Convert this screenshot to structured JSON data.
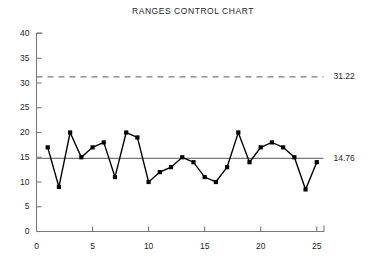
{
  "chart_data": {
    "type": "line",
    "title": "RANGES CONTROL CHART",
    "xlabel": "",
    "ylabel": "",
    "xlim": [
      0,
      25.6
    ],
    "ylim": [
      0,
      40
    ],
    "xticks": [
      0,
      5,
      10,
      15,
      20,
      25
    ],
    "yticks": [
      0,
      5,
      10,
      15,
      20,
      25,
      30,
      35,
      40
    ],
    "grid": false,
    "legend": false,
    "x": [
      1,
      2,
      3,
      4,
      5,
      6,
      7,
      8,
      9,
      10,
      11,
      12,
      13,
      14,
      15,
      16,
      17,
      18,
      19,
      20,
      21,
      22,
      23,
      24,
      25
    ],
    "values": [
      17,
      9,
      20,
      15,
      17,
      18,
      11,
      20,
      19,
      10,
      12,
      13,
      15,
      14,
      11,
      10,
      13,
      20,
      14,
      17,
      18,
      17,
      15,
      8.5,
      14
    ],
    "series": [
      {
        "name": "Range",
        "values": [
          17,
          9,
          20,
          15,
          17,
          18,
          11,
          20,
          19,
          10,
          12,
          13,
          15,
          14,
          11,
          10,
          13,
          20,
          14,
          17,
          18,
          17,
          15,
          8.5,
          14
        ]
      }
    ],
    "reference_lines": [
      {
        "name": "upper-control-limit",
        "label": "31.22",
        "value": 31.22,
        "style": "dashed"
      },
      {
        "name": "center-line",
        "label": "14.76",
        "value": 14.76,
        "style": "solid"
      }
    ],
    "colors": {
      "series": "#000000",
      "axis": "#7a7a7a",
      "reference_line": "#7a7a7a",
      "text": "#1f1f1f",
      "background": "#ffffff"
    },
    "marker": "square"
  }
}
